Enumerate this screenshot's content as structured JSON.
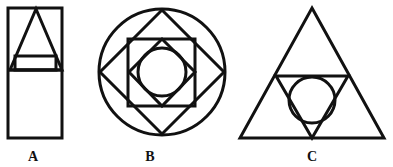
{
  "page": {
    "background_color": "#ffffff",
    "stroke_color": "#111111",
    "stroke_width": 3,
    "width": 393,
    "height": 167
  },
  "figures": [
    {
      "id": "figure-a",
      "label": "A",
      "label_x": 33,
      "label_y": 157,
      "description": "Tall upright rectangle containing an isosceles triangle in its upper half, with a small horizontal rectangle straddling the triangle's base and a horizontal divider line across the rectangle",
      "shapes": [
        {
          "name": "outer-rectangle",
          "type": "rect",
          "x": 8,
          "y": 8,
          "width": 54,
          "height": 130
        },
        {
          "name": "divider-line",
          "type": "line",
          "x1": 8,
          "y1": 70,
          "x2": 62,
          "y2": 70
        },
        {
          "name": "triangle",
          "type": "polygon",
          "points": "36,9 62,70 10,70"
        },
        {
          "name": "inner-rectangle",
          "type": "rect",
          "x": 15,
          "y": 56,
          "width": 41,
          "height": 14
        }
      ]
    },
    {
      "id": "figure-b",
      "label": "B",
      "label_x": 150,
      "label_y": 157,
      "description": "Concentric pattern: outer circle, inscribed diamond, inscribed upright square, inner diamond and innermost circle",
      "shapes": [
        {
          "name": "outer-circle",
          "type": "circle",
          "cx": 162,
          "cy": 72,
          "r": 63
        },
        {
          "name": "outer-diamond",
          "type": "polygon",
          "points": "162,10 224,72 162,134 100,72"
        },
        {
          "name": "middle-square",
          "type": "rect",
          "x": 128,
          "y": 39,
          "width": 67,
          "height": 67
        },
        {
          "name": "inner-diamond",
          "type": "polygon",
          "points": "162,39 195,72 162,106 129,72"
        },
        {
          "name": "inner-circle",
          "type": "circle",
          "cx": 162,
          "cy": 72,
          "r": 24
        }
      ]
    },
    {
      "id": "figure-c",
      "label": "C",
      "label_x": 312,
      "label_y": 157,
      "description": "Large upright triangle containing an inverted medial triangle with a circle inscribed inside the inverted triangle",
      "shapes": [
        {
          "name": "outer-triangle",
          "type": "polygon",
          "points": "312,8 384,138 240,138"
        },
        {
          "name": "inverted-triangle",
          "type": "polygon",
          "points": "276,76 348,76 312,138"
        },
        {
          "name": "inscribed-circle",
          "type": "circle",
          "cx": 312,
          "cy": 100,
          "r": 23
        }
      ]
    }
  ]
}
